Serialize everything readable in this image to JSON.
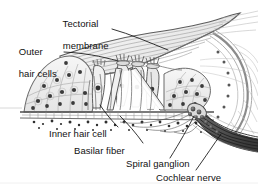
{
  "figure": {
    "background_color": "#ffffff",
    "width": 258,
    "height": 190
  },
  "labels": {
    "tectorial_membrane_line1": "Tectorial",
    "tectorial_membrane_line2": "membrane",
    "outer_hair_cells_line1": "Outer",
    "outer_hair_cells_line2": "hair cells",
    "inner_hair_cell": "Inner hair cell",
    "basilar_fiber": "Basilar fiber",
    "spiral_ganglion": "Spiral ganglion",
    "cochlear_nerve": "Cochlear nerve"
  },
  "colors": {
    "ink": "#111111",
    "leader": "#1a1a1a",
    "membrane_fill": "#f2f2f2",
    "tissue_fill": "#e9e9e9",
    "tissue_fill_light": "#f5f5f5",
    "nerve_dark": "#4a4a4a",
    "outline": "#5a5a5a",
    "cell_nucleus": "#3b3b3b"
  },
  "structures": [
    {
      "name": "tectorial-membrane",
      "description": "striated sweeping band over hair cells"
    },
    {
      "name": "outer-hair-cells",
      "description": "row of hair cells with stereocilia"
    },
    {
      "name": "inner-hair-cell",
      "description": "single hair cell medial to pillar cells"
    },
    {
      "name": "basilar-membrane",
      "description": "horizontal membrane supporting organ of Corti"
    },
    {
      "name": "basilar-fibers",
      "description": "radial fibers within basilar membrane"
    },
    {
      "name": "spiral-ganglion",
      "description": "cluster of neuron cell bodies"
    },
    {
      "name": "cochlear-nerve",
      "description": "bundle of nerve fibers exiting right"
    },
    {
      "name": "spiral-limbus",
      "description": "left tissue mass"
    },
    {
      "name": "tunnel-of-corti",
      "description": "triangular space between pillar cells"
    },
    {
      "name": "stria-vascularis",
      "description": "right outer wall lining"
    }
  ]
}
